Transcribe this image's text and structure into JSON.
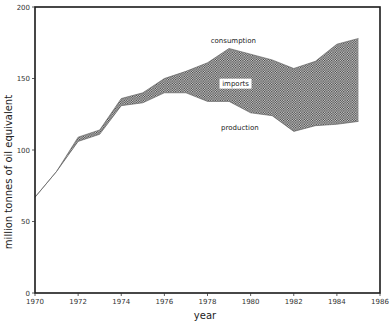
{
  "chart_data": {
    "type": "area",
    "title": "",
    "xlabel": "year",
    "ylabel": "million tonnes of oil equivalent",
    "xlim": [
      1970,
      1986
    ],
    "ylim": [
      0,
      200
    ],
    "grid": false,
    "legend": "none (inline annotations)",
    "x_ticks": [
      "1970",
      "1972",
      "1974",
      "1976",
      "1978",
      "1980",
      "1982",
      "1984",
      "1986"
    ],
    "y_ticks": [
      "0",
      "50",
      "100",
      "150",
      "200"
    ],
    "x": [
      1970,
      1971,
      1972,
      1973,
      1974,
      1975,
      1976,
      1977,
      1978,
      1979,
      1980,
      1981,
      1982,
      1983,
      1984,
      1985
    ],
    "series": [
      {
        "name": "consumption",
        "values": [
          67,
          85,
          109,
          114,
          136,
          140,
          150,
          155,
          161,
          171,
          167,
          163,
          157,
          162,
          174,
          178
        ]
      },
      {
        "name": "production",
        "values": [
          67,
          85,
          106,
          111,
          131,
          133,
          140,
          140,
          134,
          134,
          126,
          124,
          113,
          117,
          118,
          120
        ]
      }
    ],
    "shaded_region": {
      "name": "imports",
      "between": [
        "production",
        "consumption"
      ],
      "pattern": "crosshatch"
    },
    "annotations": [
      {
        "text": "consumption",
        "x": 1979.2,
        "y": 175
      },
      {
        "text": "imports",
        "x": 1979.3,
        "y": 145
      },
      {
        "text": "production",
        "x": 1979.5,
        "y": 114
      }
    ]
  }
}
